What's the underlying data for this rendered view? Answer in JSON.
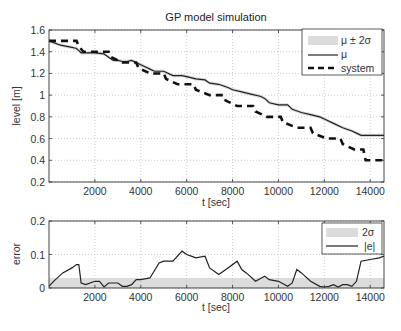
{
  "chart_data": [
    {
      "type": "line",
      "title": "GP model simulation",
      "xlabel": "t [sec]",
      "ylabel": "level [m]",
      "xlim": [
        0,
        14600
      ],
      "ylim": [
        0.2,
        1.6
      ],
      "xticks": [
        2000,
        4000,
        6000,
        8000,
        10000,
        12000,
        14000
      ],
      "yticks": [
        0.2,
        0.4,
        0.6,
        0.8,
        1,
        1.2,
        1.4,
        1.6
      ],
      "ytick_labels": [
        "0.2",
        "0.4",
        "0.6",
        "0.8",
        "1",
        "1.2",
        "1.4",
        "1.6"
      ],
      "grid": true,
      "legend_position": "upper right",
      "legend": [
        "μ ± 2σ",
        "μ",
        "system"
      ],
      "series": [
        {
          "name": "μ ± 2σ",
          "style": "shaded band",
          "color": "#d8d8d8",
          "halfwidth": 0.015
        },
        {
          "name": "μ",
          "style": "solid",
          "color": "#222222",
          "x": [
            0,
            500,
            1000,
            1200,
            1300,
            1400,
            1800,
            2000,
            2400,
            2600,
            2800,
            3000,
            3200,
            3400,
            3600,
            4000,
            4400,
            4600,
            5000,
            5400,
            5800,
            6000,
            6400,
            6800,
            7000,
            7400,
            7800,
            8000,
            8400,
            8800,
            9200,
            9400,
            9600,
            10000,
            10400,
            10600,
            11000,
            11400,
            11800,
            12000,
            12400,
            12800,
            13200,
            13400,
            13600,
            14000,
            14600
          ],
          "y": [
            1.5,
            1.46,
            1.44,
            1.43,
            1.41,
            1.39,
            1.39,
            1.39,
            1.38,
            1.35,
            1.32,
            1.32,
            1.31,
            1.31,
            1.32,
            1.28,
            1.24,
            1.22,
            1.22,
            1.18,
            1.18,
            1.17,
            1.15,
            1.14,
            1.11,
            1.1,
            1.07,
            1.05,
            1.03,
            1.01,
            0.99,
            0.97,
            0.93,
            0.91,
            0.91,
            0.87,
            0.84,
            0.82,
            0.8,
            0.78,
            0.74,
            0.7,
            0.67,
            0.65,
            0.63,
            0.63,
            0.63
          ]
        },
        {
          "name": "system",
          "style": "dashed",
          "color": "#111111",
          "x": [
            0,
            500,
            600,
            1200,
            1300,
            1500,
            2000,
            2100,
            2600,
            2700,
            3200,
            3300,
            3800,
            3900,
            4400,
            4500,
            5000,
            5100,
            5600,
            5700,
            6300,
            6400,
            7000,
            7100,
            7600,
            7700,
            8200,
            8300,
            8900,
            9000,
            9500,
            9600,
            10100,
            10200,
            10800,
            10900,
            11400,
            11500,
            12100,
            12200,
            12700,
            12800,
            13300,
            13400,
            13700,
            13800,
            14600
          ],
          "y": [
            1.5,
            1.5,
            1.5,
            1.5,
            1.45,
            1.4,
            1.4,
            1.4,
            1.4,
            1.35,
            1.3,
            1.3,
            1.3,
            1.25,
            1.2,
            1.2,
            1.2,
            1.15,
            1.1,
            1.1,
            1.1,
            1.05,
            1.0,
            1.0,
            1.0,
            0.95,
            0.9,
            0.9,
            0.9,
            0.85,
            0.8,
            0.8,
            0.8,
            0.75,
            0.7,
            0.7,
            0.7,
            0.65,
            0.6,
            0.6,
            0.6,
            0.55,
            0.5,
            0.5,
            0.5,
            0.4,
            0.4
          ]
        }
      ]
    },
    {
      "type": "line",
      "title": "",
      "xlabel": "t [sec]",
      "ylabel": "error",
      "xlim": [
        0,
        14600
      ],
      "ylim": [
        0,
        0.2
      ],
      "xticks": [
        2000,
        4000,
        6000,
        8000,
        10000,
        12000,
        14000
      ],
      "yticks": [
        0,
        0.1,
        0.2
      ],
      "ytick_labels": [
        "0",
        "0.1",
        "0.2"
      ],
      "grid": true,
      "legend_position": "upper right",
      "legend": [
        "2σ",
        "|e|"
      ],
      "series": [
        {
          "name": "2σ",
          "style": "shaded band",
          "color": "#dcdcdc",
          "x": [
            0,
            14600
          ],
          "y": [
            0.03,
            0.03
          ]
        },
        {
          "name": "|e|",
          "style": "solid",
          "color": "#222222",
          "x": [
            0,
            200,
            600,
            1000,
            1200,
            1300,
            1400,
            1600,
            2000,
            2200,
            2400,
            2600,
            3000,
            3200,
            3400,
            3600,
            3800,
            4000,
            4400,
            4800,
            5000,
            5400,
            5800,
            6000,
            6200,
            6400,
            6800,
            7000,
            7400,
            7800,
            8200,
            8400,
            8600,
            9000,
            9400,
            9600,
            10000,
            10400,
            10600,
            10800,
            11000,
            11400,
            11800,
            12000,
            12200,
            12400,
            12600,
            12800,
            13000,
            13200,
            13400,
            13600,
            14000,
            14400,
            14600
          ],
          "y": [
            0.005,
            0.02,
            0.045,
            0.06,
            0.07,
            0.07,
            0.015,
            0.01,
            0.02,
            0.02,
            0.003,
            0.015,
            0.015,
            0.005,
            0.005,
            0.01,
            0.025,
            0.025,
            0.03,
            0.075,
            0.08,
            0.08,
            0.11,
            0.1,
            0.095,
            0.09,
            0.095,
            0.06,
            0.04,
            0.06,
            0.08,
            0.055,
            0.045,
            0.02,
            0.035,
            0.025,
            0.02,
            0.005,
            0.015,
            0.055,
            0.045,
            0.02,
            0.005,
            0.003,
            0.005,
            0.01,
            0.003,
            0.01,
            0.01,
            0.005,
            0.02,
            0.08,
            0.085,
            0.09,
            0.095
          ]
        }
      ]
    }
  ]
}
